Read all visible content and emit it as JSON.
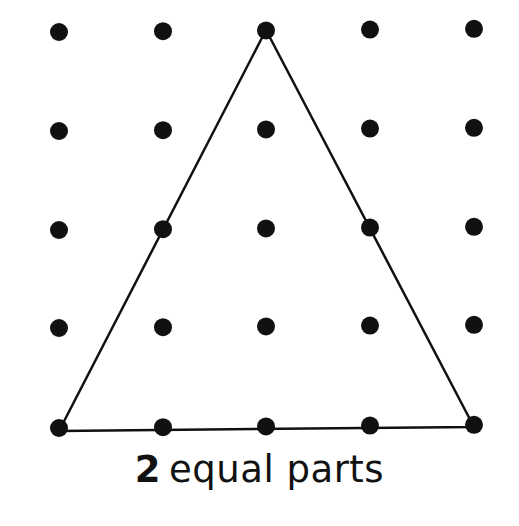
{
  "diagram": {
    "type": "dot-grid-shape",
    "grid": {
      "rows": 5,
      "cols": 5,
      "dot_color": "#111111",
      "dot_radius": 9,
      "x": [
        59,
        163,
        266,
        370,
        474
      ],
      "y": [
        32,
        131,
        230,
        328,
        428
      ]
    },
    "shape": {
      "name": "triangle",
      "stroke": "#111111",
      "vertices": [
        [
          266,
          30
        ],
        [
          59,
          431
        ],
        [
          474,
          427
        ]
      ]
    }
  },
  "caption": {
    "number": "2",
    "text": "equal parts"
  }
}
